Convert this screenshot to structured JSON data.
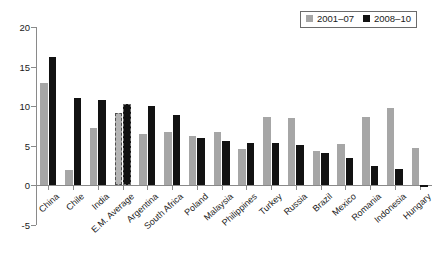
{
  "chart_data": {
    "type": "bar",
    "title": "",
    "subtitle": "",
    "xlabel": "",
    "ylabel": "",
    "ylim": [
      -5,
      20
    ],
    "yticks": [
      -5,
      0,
      5,
      10,
      15,
      20
    ],
    "ytick_labels": [
      "-5",
      "0",
      "5",
      "10",
      "15",
      "20"
    ],
    "grid": false,
    "legend_position": "top-right",
    "categories": [
      "China",
      "Chile",
      "India",
      "E.M. Average",
      "Argentina",
      "South Africa",
      "Poland",
      "Malaysia",
      "Philippines",
      "Turkey",
      "Russia",
      "Brazil",
      "Mexico",
      "Romania",
      "Indonesia",
      "Hungary"
    ],
    "series": [
      {
        "name": "2001–07",
        "color": "#a6a6a6",
        "values": [
          12.9,
          1.9,
          7.3,
          9.2,
          6.5,
          6.7,
          6.3,
          6.7,
          4.6,
          8.6,
          8.5,
          4.3,
          5.2,
          8.7,
          9.8,
          4.7
        ]
      },
      {
        "name": "2008–10",
        "color": "#121212",
        "values": [
          16.2,
          11.1,
          10.8,
          10.3,
          10.0,
          8.9,
          6.0,
          5.6,
          5.4,
          5.3,
          5.1,
          4.1,
          3.4,
          2.5,
          2.1,
          -0.2
        ]
      }
    ],
    "highlight_category": "E.M. Average",
    "highlight_style": "dashed-outline"
  },
  "legend": {
    "entries": [
      {
        "label": "2001–07",
        "swatch": "gray"
      },
      {
        "label": "2008–10",
        "swatch": "black"
      }
    ]
  }
}
